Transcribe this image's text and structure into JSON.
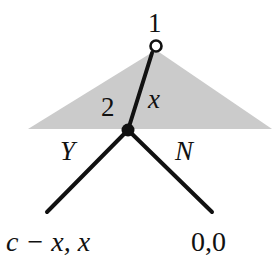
{
  "figure": {
    "background_color": "#ffffff",
    "line_color": "#111111",
    "shade_color": "#cccccc"
  },
  "nodes": [
    {
      "id": "root",
      "label": "1",
      "player": "1",
      "marker": "open-circle",
      "x": 156,
      "y": 46
    },
    {
      "id": "decision",
      "label": "2",
      "player": "2",
      "marker": "filled-circle",
      "x": 128,
      "y": 130
    }
  ],
  "edges": [
    {
      "id": "offer",
      "label": "x",
      "from": "root",
      "to": "decision"
    },
    {
      "id": "accept",
      "label": "Y",
      "from": "decision",
      "to": "payoff-left"
    },
    {
      "id": "reject",
      "label": "N",
      "from": "decision",
      "to": "payoff-right"
    }
  ],
  "payoffs": [
    {
      "id": "payoff-left",
      "label": "c − x, x",
      "style": "italic"
    },
    {
      "id": "payoff-right",
      "label": "0,0",
      "style": "plain"
    }
  ],
  "shaded_region": {
    "name": "information-set-triangle",
    "apex_x": 156,
    "apex_y": 50,
    "base_y": 129,
    "left_x": 28,
    "right_x": 272
  }
}
